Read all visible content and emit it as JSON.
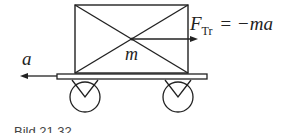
{
  "diagram": {
    "labels": {
      "force_symbol": "F",
      "force_subscript": "Tr",
      "force_rhs": "= −ma",
      "acceleration": "a",
      "mass": "m"
    },
    "caption": "Bild 21.32",
    "colors": {
      "line": "#222222",
      "background": "#ffffff"
    }
  }
}
